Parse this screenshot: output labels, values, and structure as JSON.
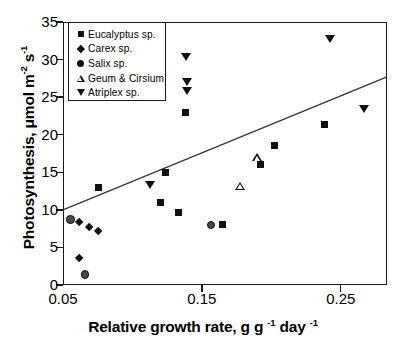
{
  "chart_data": {
    "type": "scatter",
    "title": "",
    "xlabel": "Relative growth rate, g g -1 day -1",
    "ylabel": "Photosynthesis, μmol m -2 s -1",
    "xlim": [
      0.05,
      0.2833
    ],
    "ylim": [
      0,
      35
    ],
    "xticks": [
      0.05,
      0.15,
      0.25
    ],
    "xtick_labels": [
      "0.05",
      "0.15",
      "0.25"
    ],
    "yticks": [
      0,
      5,
      10,
      15,
      20,
      25,
      30,
      35
    ],
    "ytick_labels": [
      "0",
      "5",
      "10",
      "15",
      "20",
      "25",
      "30",
      "35"
    ],
    "grid": false,
    "legend_position": "top-left",
    "series": [
      {
        "name": "Eucalyptus sp.",
        "marker": "square-filled",
        "points": [
          {
            "x": 0.1385,
            "y": 23.0
          },
          {
            "x": 0.1235,
            "y": 15.0
          },
          {
            "x": 0.12,
            "y": 11.0
          },
          {
            "x": 0.133,
            "y": 9.7
          },
          {
            "x": 0.165,
            "y": 8.0
          },
          {
            "x": 0.192,
            "y": 16.0
          },
          {
            "x": 0.202,
            "y": 18.6
          },
          {
            "x": 0.2385,
            "y": 21.4
          },
          {
            "x": 0.0755,
            "y": 13.0
          }
        ]
      },
      {
        "name": "Carex  sp.",
        "marker": "diamond-filled",
        "points": [
          {
            "x": 0.0615,
            "y": 8.3
          },
          {
            "x": 0.069,
            "y": 7.7
          },
          {
            "x": 0.062,
            "y": 3.6
          },
          {
            "x": 0.0755,
            "y": 7.1
          }
        ]
      },
      {
        "name": "Salix  sp.",
        "marker": "circle-filled",
        "points": [
          {
            "x": 0.0555,
            "y": 8.7
          },
          {
            "x": 0.066,
            "y": 1.4
          },
          {
            "x": 0.1565,
            "y": 8.0
          }
        ]
      },
      {
        "name": "Geum & Cirsium",
        "marker": "triangle-up-open",
        "points": [
          {
            "x": 0.1775,
            "y": 13.2
          },
          {
            "x": 0.19,
            "y": 17.0
          }
        ]
      },
      {
        "name": "Atriplex sp.",
        "marker": "triangle-down-filled",
        "points": [
          {
            "x": 0.1385,
            "y": 30.4
          },
          {
            "x": 0.139,
            "y": 27.0
          },
          {
            "x": 0.139,
            "y": 25.8
          },
          {
            "x": 0.1125,
            "y": 13.3
          },
          {
            "x": 0.2425,
            "y": 32.8
          },
          {
            "x": 0.2665,
            "y": 23.4
          }
        ]
      }
    ],
    "trendline": {
      "x_start": 0.05,
      "y_start": 10.0,
      "x_end": 0.2833,
      "y_end": 27.7
    }
  },
  "legend": {
    "items": [
      {
        "label": "Eucalyptus sp.",
        "marker": "square-filled"
      },
      {
        "label": "Carex  sp.",
        "marker": "diamond-filled"
      },
      {
        "label": "Salix  sp.",
        "marker": "circle-filled"
      },
      {
        "label": "Geum & Cirsium",
        "marker": "triangle-up-open"
      },
      {
        "label": "Atriplex sp.",
        "marker": "triangle-down-filled"
      }
    ]
  },
  "axes": {
    "y_title_main": "Photosynthesis, ",
    "y_title_mu": "μ",
    "y_title_unit1": "mol m",
    "y_title_sup1": "-2",
    "y_title_unit2": " s",
    "y_title_sup2": "-1",
    "x_title_main": "Relative growth rate, g g ",
    "x_title_sup1": "-1",
    "x_title_mid": " day ",
    "x_title_sup2": "-1"
  },
  "colors": {
    "axis": "#1a1a1a",
    "marker": "#111111",
    "circle_fill": "#4a4a4a",
    "background": "#ffffff",
    "trendline": "#333333"
  }
}
